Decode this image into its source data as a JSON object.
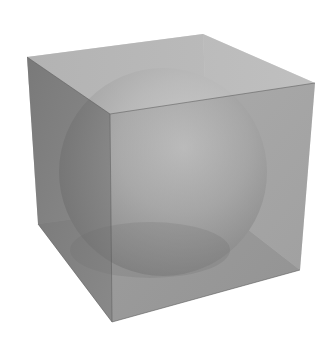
{
  "scene": {
    "subject": "Sphere inscribed in a translucent cube",
    "background_color": "#ffffff",
    "cube": {
      "vertices": {
        "top_left": [
          27,
          57
        ],
        "top_back": [
          203,
          34
        ],
        "top_right": [
          315,
          83
        ],
        "top_front": [
          110,
          114
        ],
        "bottom_left": [
          38,
          224
        ],
        "bottom_front": [
          112,
          322
        ],
        "bottom_right": [
          300,
          270
        ],
        "bottom_back": [
          210,
          200
        ]
      },
      "colors": {
        "top_face": "#b4b4b4",
        "left_face": "#6e6e6e",
        "right_face": "#7c7c7c",
        "edge": "#5a5a5a"
      }
    },
    "sphere": {
      "center": [
        163,
        172
      ],
      "radius": 104,
      "highlight_color": "#e2e2e2",
      "shadow_color": "#7a7a7a"
    }
  }
}
